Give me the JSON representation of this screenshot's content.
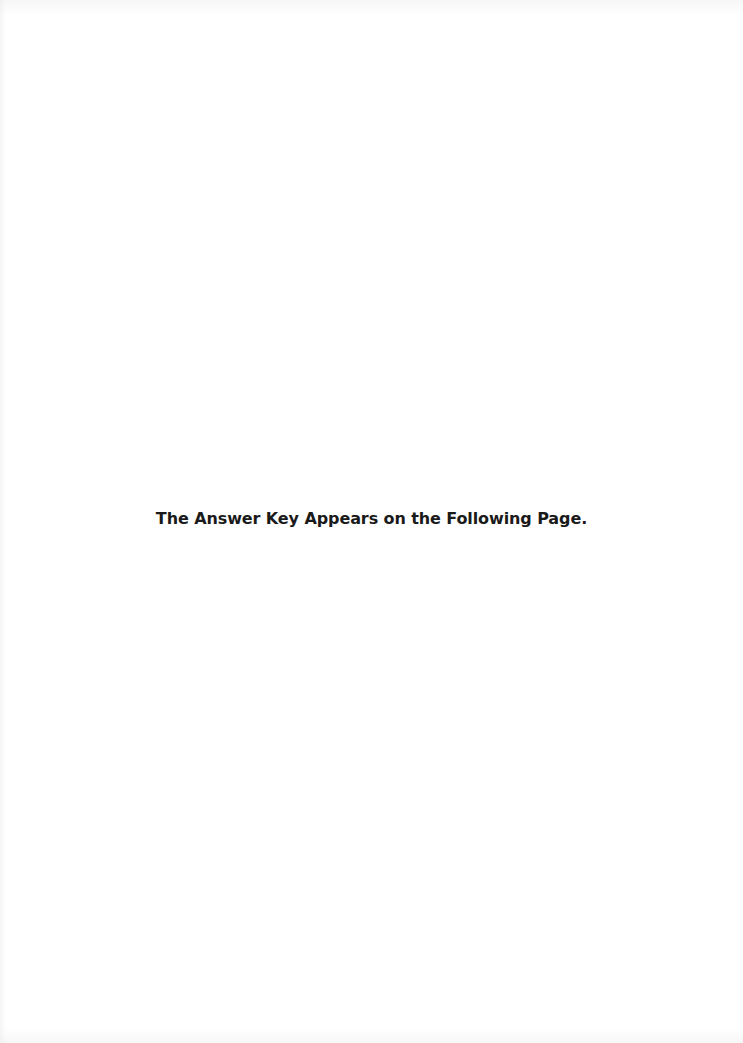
{
  "page": {
    "notice_text": "The Answer Key Appears on the Following Page.",
    "background_color": "#ffffff",
    "text_color": "#1a1a1a"
  }
}
